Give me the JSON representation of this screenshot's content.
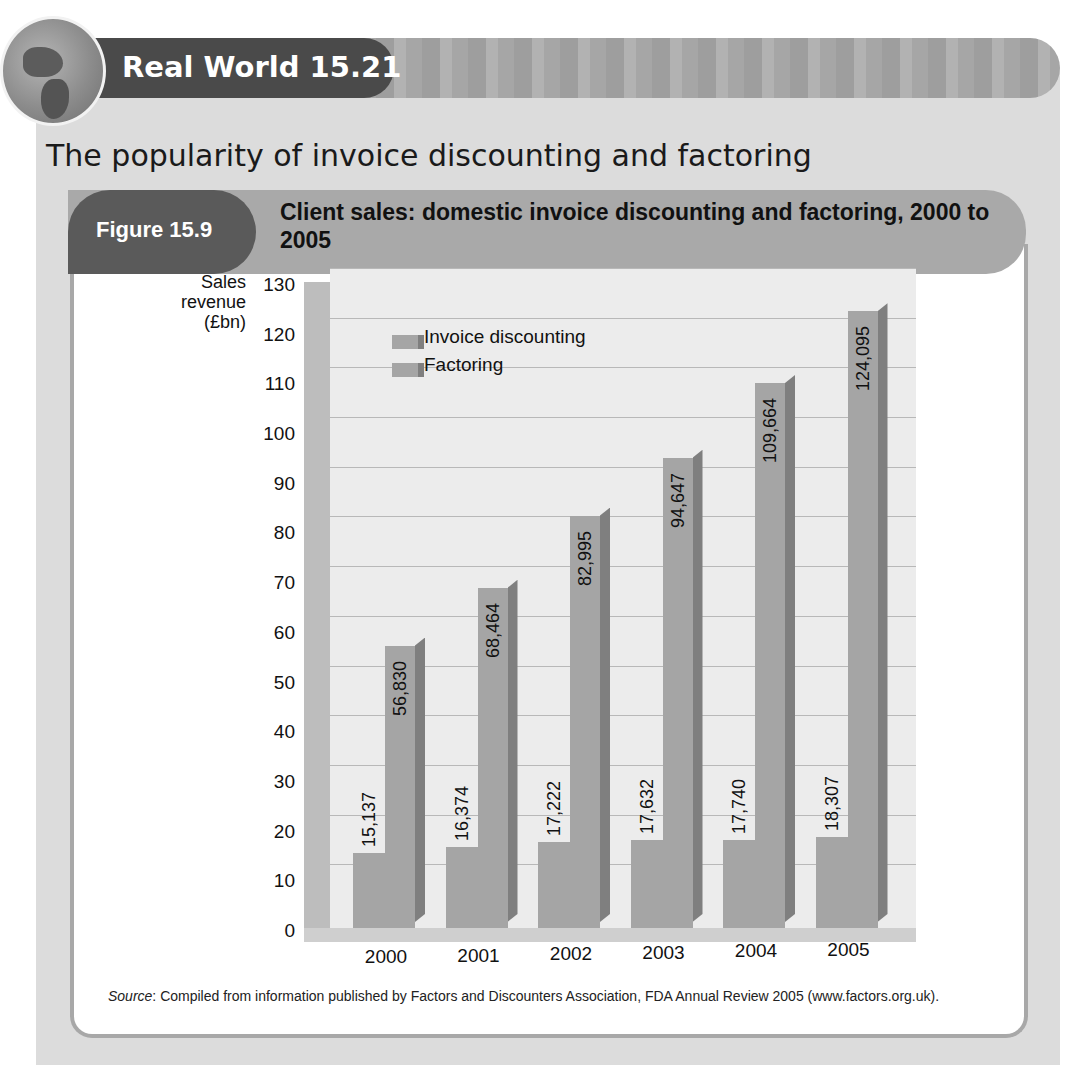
{
  "banner": {
    "title": "Real World 15.21",
    "icon": "globe-icon"
  },
  "heading": "The popularity of invoice discounting and factoring",
  "figure": {
    "label": "Figure 15.9",
    "title": "Client sales: domestic invoice discounting and factoring, 2000 to 2005"
  },
  "chart_data": {
    "type": "bar",
    "title": "Client sales: domestic invoice discounting and factoring, 2000 to 2005",
    "xlabel": "",
    "ylabel": "Sales revenue (£bn)",
    "ylim": [
      0,
      130
    ],
    "yticks": [
      0,
      10,
      20,
      30,
      40,
      50,
      60,
      70,
      80,
      90,
      100,
      110,
      120,
      130
    ],
    "grid": true,
    "style": "3d",
    "legend_position": "top-left inside plot",
    "categories": [
      "2000",
      "2001",
      "2002",
      "2003",
      "2004",
      "2005"
    ],
    "series": [
      {
        "name": "Invoice discounting",
        "values": [
          15.137,
          16.374,
          17.222,
          17.632,
          17.74,
          18.307
        ],
        "labels": [
          "15,137",
          "16,374",
          "17,222",
          "17,632",
          "17,740",
          "18,307"
        ]
      },
      {
        "name": "Factoring",
        "values": [
          56.83,
          68.464,
          82.995,
          94.647,
          109.664,
          124.095
        ],
        "labels": [
          "56,830",
          "68,464",
          "82,995",
          "94,647",
          "109,664",
          "124,095"
        ]
      }
    ]
  },
  "axis": {
    "ylabel_line1": "Sales",
    "ylabel_line2": "revenue",
    "ylabel_line3": "(£bn)"
  },
  "legend": {
    "item1": "Invoice discounting",
    "item2": "Factoring"
  },
  "source": {
    "prefix": "Source",
    "text": ": Compiled from information published by Factors and Discounters Association, FDA Annual Review 2005 (www.factors.org.uk)."
  },
  "colors": {
    "bar": "#a5a5a5",
    "bar_side": "#7f7f7f",
    "banner_dark": "#4a4a4a",
    "figure_pill": "#5a5a5a",
    "figure_band": "#a9a9a9",
    "panel": "#dcdcdc"
  }
}
